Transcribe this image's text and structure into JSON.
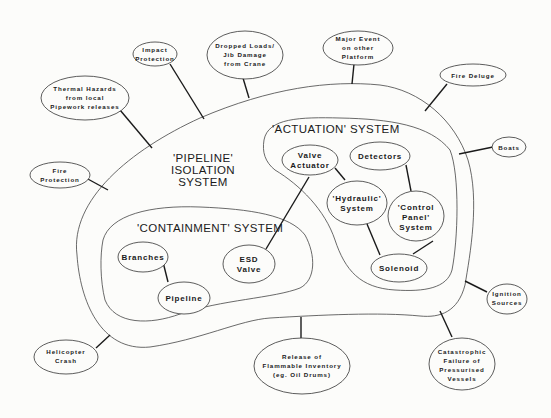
{
  "systems": {
    "pipeline": {
      "line1": "'PIPELINE'",
      "line2": "ISOLATION",
      "line3": "SYSTEM"
    },
    "actuation": {
      "label": "'ACTUATION' SYSTEM"
    },
    "containment": {
      "label": "'CONTAINMENT' SYSTEM"
    }
  },
  "inner_nodes": {
    "valve_actuator": [
      "Valve",
      "Actuator"
    ],
    "detectors": [
      "Detectors"
    ],
    "hydraulic": [
      "'Hydraulic'",
      "System"
    ],
    "control_panel": [
      "'Control",
      "Panel'",
      "System"
    ],
    "solenoid": [
      "Solenoid"
    ],
    "branches": [
      "Branches"
    ],
    "pipeline": [
      "Pipeline"
    ],
    "esd_valve": [
      "ESD",
      "Valve"
    ]
  },
  "hazards": {
    "impact_protection": [
      "Impact",
      "Protection"
    ],
    "dropped_loads": [
      "Dropped Loads/",
      "Jib Damage",
      "from Crane"
    ],
    "major_event": [
      "Major Event",
      "on other",
      "Platform"
    ],
    "fire_deluge": [
      "Fire Deluge"
    ],
    "boats": [
      "Boats"
    ],
    "thermal_hazards": [
      "Thermal Hazards",
      "from local",
      "Pipework releases"
    ],
    "fire_protection": [
      "Fire",
      "Protection"
    ],
    "ignition_sources": [
      "Ignition",
      "Sources"
    ],
    "catastrophic_failure": [
      "Catastrophic",
      "Failure of",
      "Pressurised",
      "Vessels"
    ],
    "release_flammable": [
      "Release of",
      "Flammable Inventory",
      "(eg. Oil Drums)"
    ],
    "helicopter_crash": [
      "Helicopter",
      "Crash"
    ]
  }
}
